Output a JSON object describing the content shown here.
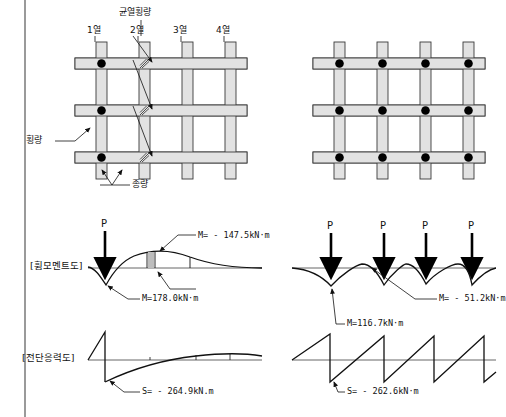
{
  "figure": {
    "title_implicit": "",
    "colors": {
      "beam_fill": "#e0e0e0",
      "beam_stroke": "#333333",
      "node_dot": "#000000",
      "line": "#111111",
      "axis": "#444444",
      "left_rule": "#9a9a9a"
    }
  },
  "left_panel": {
    "crack_label": "균열횡량",
    "column_headers": [
      "1열",
      "2열",
      "3열",
      "4열"
    ],
    "beam_labels": {
      "transverse": "횡량",
      "longitudinal": "종량"
    },
    "node_dots_count": 3,
    "crack_marks_count": 3,
    "moment_diagram": {
      "label": "[휨모멘트도]",
      "loads": [
        "P"
      ],
      "annotations": [
        {
          "text": "M= - 147.5kN·m",
          "sign": "negative",
          "value": -147.5,
          "unit": "kN·m"
        },
        {
          "text": "M=178.0kN·m",
          "sign": "positive",
          "value": 178.0,
          "unit": "kN·m"
        }
      ]
    },
    "shear_diagram": {
      "label": "[전단응력도]",
      "annotations": [
        {
          "text": "S= - 264.9kN.m",
          "sign": "negative",
          "value": -264.9,
          "unit": "kN.m"
        }
      ]
    }
  },
  "right_panel": {
    "node_dots_count": 12,
    "moment_diagram": {
      "loads": [
        "P",
        "P",
        "P",
        "P"
      ],
      "annotations": [
        {
          "text": "M= - 51.2kN·m",
          "sign": "negative",
          "value": -51.2,
          "unit": "kN·m"
        },
        {
          "text": "M=116.7kN·m",
          "sign": "positive",
          "value": 116.7,
          "unit": "kN·m"
        }
      ]
    },
    "shear_diagram": {
      "annotations": [
        {
          "text": "S= - 262.6kN·m",
          "sign": "negative",
          "value": -262.6,
          "unit": "kN·m"
        }
      ]
    }
  }
}
